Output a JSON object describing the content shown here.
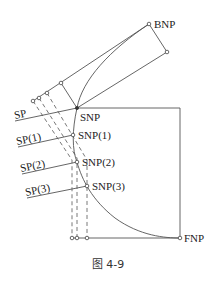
{
  "figure": {
    "caption": "图 4-9",
    "labels": {
      "bnp": "BNP",
      "snp": "SNP",
      "snp1": "SNP(1)",
      "snp2": "SNP(2)",
      "snp3": "SNP(3)",
      "fnp": "FNP",
      "sp": "SP",
      "sp1": "SP(1)",
      "sp2": "SP(2)",
      "sp3": "SP(3)"
    }
  }
}
